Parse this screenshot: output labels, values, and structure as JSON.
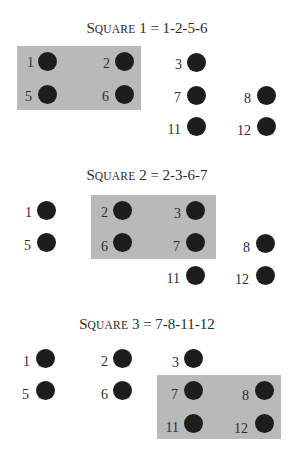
{
  "colors": {
    "highlight": "#b9b9b9",
    "dot": "#1d1d1d",
    "text": "#2e2e2e",
    "background": "#ffffff"
  },
  "panels": [
    {
      "title_first": "S",
      "title_rest": "QUARE",
      "title_suffix": " 1 = 1-2-5-6",
      "title": "Square 1 = 1-2-5-6",
      "highlighted": [
        "1",
        "2",
        "5",
        "6"
      ],
      "dots": [
        {
          "label": "1",
          "x": 47,
          "y": 61
        },
        {
          "label": "2",
          "x": 124,
          "y": 61
        },
        {
          "label": "3",
          "x": 196,
          "y": 62
        },
        {
          "label": "5",
          "x": 47,
          "y": 94
        },
        {
          "label": "6",
          "x": 124,
          "y": 94
        },
        {
          "label": "7",
          "x": 196,
          "y": 95
        },
        {
          "label": "8",
          "x": 266,
          "y": 95
        },
        {
          "label": "11",
          "x": 196,
          "y": 126
        },
        {
          "label": "12",
          "x": 266,
          "y": 126
        }
      ]
    },
    {
      "title_first": "S",
      "title_rest": "QUARE",
      "title_suffix": " 2 = 2-3-6-7",
      "title": "Square 2 = 2-3-6-7",
      "highlighted": [
        "2",
        "3",
        "6",
        "7"
      ],
      "dots": [
        {
          "label": "1",
          "x": 46,
          "y": 60
        },
        {
          "label": "2",
          "x": 122,
          "y": 60
        },
        {
          "label": "3",
          "x": 195,
          "y": 60
        },
        {
          "label": "5",
          "x": 46,
          "y": 92
        },
        {
          "label": "6",
          "x": 122,
          "y": 92
        },
        {
          "label": "7",
          "x": 195,
          "y": 92
        },
        {
          "label": "8",
          "x": 265,
          "y": 93
        },
        {
          "label": "11",
          "x": 195,
          "y": 125
        },
        {
          "label": "12",
          "x": 265,
          "y": 125
        }
      ]
    },
    {
      "title_first": "S",
      "title_rest": "QUARE",
      "title_suffix": " 3 = 7-8-11-12",
      "title": "Square 3 = 7-8-11-12",
      "highlighted": [
        "7",
        "8",
        "11",
        "12"
      ],
      "dots": [
        {
          "label": "1",
          "x": 45,
          "y": 58
        },
        {
          "label": "2",
          "x": 122,
          "y": 58
        },
        {
          "label": "3",
          "x": 193,
          "y": 58
        },
        {
          "label": "5",
          "x": 45,
          "y": 90
        },
        {
          "label": "6",
          "x": 122,
          "y": 90
        },
        {
          "label": "7",
          "x": 193,
          "y": 90
        },
        {
          "label": "8",
          "x": 264,
          "y": 90
        },
        {
          "label": "11",
          "x": 193,
          "y": 123
        },
        {
          "label": "12",
          "x": 264,
          "y": 123
        }
      ]
    }
  ]
}
